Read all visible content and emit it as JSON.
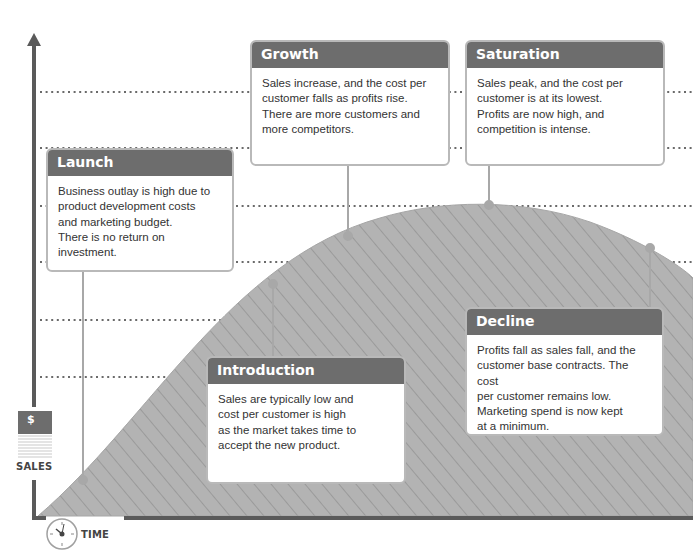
{
  "diagram": {
    "type": "product-lifecycle",
    "axes": {
      "y_label": "SALES",
      "y_icon": "dollar-icon",
      "y_icon_symbol": "$",
      "x_label": "TIME",
      "x_icon": "clock-icon"
    },
    "colors": {
      "axis": "#5a5a5a",
      "curve_fill": "#b3b3b3",
      "hatch": "#8f8f8f",
      "header": "#6d6d6d",
      "box_border": "#b9b9b9",
      "dotted_line": "#6a6a6a"
    },
    "stages": [
      {
        "id": "launch",
        "title": "Launch",
        "text": "Business outlay is high due to\nproduct development costs\nand marketing budget.\nThere is no return on\ninvestment."
      },
      {
        "id": "introduction",
        "title": "Introduction",
        "text": "Sales are typically low and\ncost per customer is high\nas the market takes time to\naccept the new product."
      },
      {
        "id": "growth",
        "title": "Growth",
        "text": "Sales increase, and the cost per\ncustomer falls as profits rise.\nThere are more customers and\nmore competitors."
      },
      {
        "id": "saturation",
        "title": "Saturation",
        "text": "Sales peak, and the cost per\ncustomer is at its lowest.\nProfits are now high, and\ncompetition is intense."
      },
      {
        "id": "decline",
        "title": "Decline",
        "text": "Profits fall as sales fall, and the\ncustomer base contracts. The cost\nper customer remains low.\nMarketing spend is now kept\nat a minimum."
      }
    ]
  }
}
